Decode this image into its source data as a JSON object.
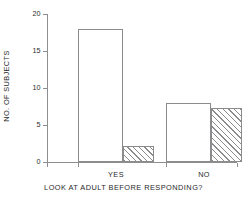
{
  "chart_data": {
    "type": "bar",
    "title": "",
    "xlabel": "LOOK AT ADULT BEFORE RESPONDING?",
    "ylabel": "NO. OF SUBJECTS",
    "categories": [
      "YES",
      "NO"
    ],
    "series": [
      {
        "name": "open",
        "style": "unfilled",
        "values": [
          18,
          8
        ]
      },
      {
        "name": "hatched",
        "style": "diagonal-hatch",
        "values": [
          2.2,
          7.3
        ]
      }
    ],
    "ylim": [
      0,
      20
    ],
    "yticks": [
      0,
      5,
      10,
      15,
      20
    ],
    "ytick_labels": [
      "0",
      "5",
      "10",
      "15",
      "20"
    ],
    "grid": false,
    "legend": "none",
    "axis_color": "#8e8e90",
    "bar_edge_color": "#8b8b8d",
    "background": "#ffffff"
  }
}
